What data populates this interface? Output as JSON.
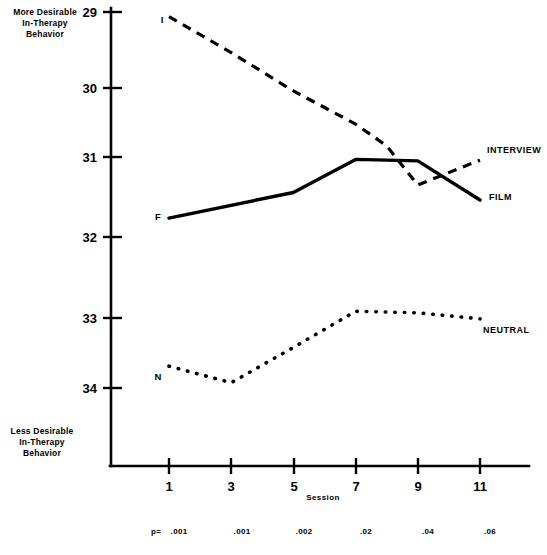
{
  "chart_data": {
    "type": "line",
    "title": "",
    "xlabel": "Session",
    "ylabel": "",
    "x": [
      1,
      2,
      3,
      4,
      5,
      6,
      7,
      8,
      9,
      10,
      11
    ],
    "xticks": [
      1,
      3,
      5,
      7,
      9,
      11
    ],
    "yticks": [
      29,
      30,
      31,
      32,
      33,
      34
    ],
    "ylim": [
      34.4,
      28.9
    ],
    "xlim": [
      0.2,
      12.2
    ],
    "y_axis_inverted": true,
    "grid": false,
    "legend_position": "right-inline",
    "y_axis_top_caption": "More Desirable\nIn-Therapy\nBehavior",
    "y_axis_bottom_caption": "Less Desirable\nIn-Therapy\nBehavior",
    "series": [
      {
        "name": "INTERVIEW",
        "marker_letter": "I",
        "style": "dashed",
        "label": "INTERVIEW",
        "points": [
          {
            "x": 1,
            "y": 29.06
          },
          {
            "x": 3,
            "y": 29.54
          },
          {
            "x": 5,
            "y": 30.05
          },
          {
            "x": 7,
            "y": 30.49
          },
          {
            "x": 8,
            "y": 30.78
          },
          {
            "x": 9,
            "y": 31.3
          },
          {
            "x": 11,
            "y": 30.97
          }
        ]
      },
      {
        "name": "FILM",
        "marker_letter": "F",
        "style": "solid",
        "label": "FILM",
        "points": [
          {
            "x": 1,
            "y": 31.74
          },
          {
            "x": 5,
            "y": 31.4
          },
          {
            "x": 7,
            "y": 30.96
          },
          {
            "x": 9,
            "y": 30.98
          },
          {
            "x": 11,
            "y": 31.5
          }
        ]
      },
      {
        "name": "NEUTRAL",
        "marker_letter": "N",
        "style": "dotted",
        "label": "NEUTRAL",
        "points": [
          {
            "x": 1,
            "y": 33.71
          },
          {
            "x": 3,
            "y": 33.93
          },
          {
            "x": 5,
            "y": 33.46
          },
          {
            "x": 7,
            "y": 32.98
          },
          {
            "x": 9,
            "y": 33.0
          },
          {
            "x": 11,
            "y": 33.08
          }
        ]
      }
    ],
    "p_values": [
      {
        "session": 1,
        "label": ".001",
        "prefix": "p="
      },
      {
        "session": 3,
        "label": ".001",
        "prefix": ""
      },
      {
        "session": 5,
        "label": ".002",
        "prefix": ""
      },
      {
        "session": 7,
        "label": ".02",
        "prefix": ""
      },
      {
        "session": 9,
        "label": ".04",
        "prefix": ""
      },
      {
        "session": 11,
        "label": ".06",
        "prefix": ""
      }
    ]
  },
  "labels": {
    "y_top_line1": "More Desirable",
    "y_top_line2": "In-Therapy",
    "y_top_line3": "Behavior",
    "y_bottom_line1": "Less Desirable",
    "y_bottom_line2": "In-Therapy",
    "y_bottom_line3": "Behavior",
    "xaxis_title": "Session",
    "ytick_29": "29",
    "ytick_30": "30",
    "ytick_31": "31",
    "ytick_32": "32",
    "ytick_33": "33",
    "ytick_34": "34",
    "xtick_1": "1",
    "xtick_3": "3",
    "xtick_5": "5",
    "xtick_7": "7",
    "xtick_9": "9",
    "xtick_11": "11",
    "legend_interview": "INTERVIEW",
    "legend_film": "FILM",
    "legend_neutral": "NEUTRAL",
    "marker_i": "I",
    "marker_f": "F",
    "marker_n": "N",
    "p_prefix": "p=",
    "p1": ".001",
    "p3": ".001",
    "p5": ".002",
    "p7": ".02",
    "p9": ".04",
    "p11": ".06"
  },
  "colors": {
    "ink": "#000000",
    "background": "#ffffff"
  }
}
